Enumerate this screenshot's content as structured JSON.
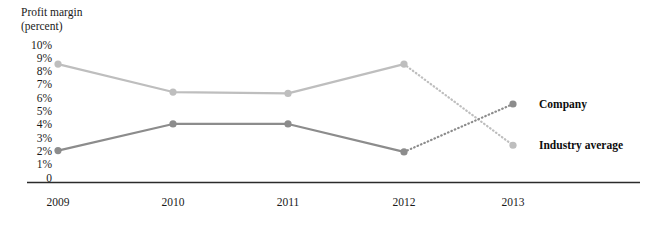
{
  "chart_data": {
    "type": "line",
    "title": "Profit margin\n(percent)",
    "xlabel": "",
    "ylabel": "Profit margin (percent)",
    "categories": [
      "2009",
      "2010",
      "2011",
      "2012",
      "2013"
    ],
    "x": [
      2009,
      2010,
      2011,
      2012,
      2013
    ],
    "ylim": [
      0,
      10
    ],
    "ytick_labels": [
      "10%",
      "9%",
      "8%",
      "7%",
      "6%",
      "5%",
      "4%",
      "3%",
      "2%",
      "1%",
      "0"
    ],
    "ytick_values": [
      10,
      9,
      8,
      7,
      6,
      5,
      4,
      3,
      2,
      1,
      0
    ],
    "grid": false,
    "legend_position": "right-inline",
    "series": [
      {
        "name": "Industry average",
        "values": [
          8.6,
          6.5,
          6.4,
          8.6,
          2.5
        ],
        "color": "#bebebe",
        "marker": "circle",
        "solid_until_index": 3,
        "forecast_style": "dotted"
      },
      {
        "name": "Company",
        "values": [
          2.1,
          4.1,
          4.1,
          2.0,
          5.6
        ],
        "color": "#8c8c8c",
        "marker": "circle",
        "solid_until_index": 3,
        "forecast_style": "dotted"
      }
    ],
    "axis_color": "#2b2b2b"
  }
}
